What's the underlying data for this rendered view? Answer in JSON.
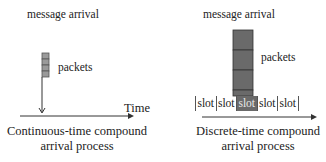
{
  "left_panel": {
    "message_label": "message arrival",
    "packets_label": "packets",
    "time_label": "Time",
    "packet_count": 4,
    "caption_line1": "Continuous-time compound",
    "caption_line2": "arrival process"
  },
  "right_panel": {
    "message_label": "message arrival",
    "packets_label": "packets",
    "slots": [
      "slot",
      "slot",
      "slot",
      "slot",
      "slot"
    ],
    "active_slot_index": 2,
    "packet_count": 4,
    "caption_line1": "Discrete-time compound",
    "caption_line2": "arrival process"
  },
  "colors": {
    "packet_fill_light": "#9a9a9a",
    "packet_fill_dark": "#6a6a6a",
    "line": "#333333"
  }
}
